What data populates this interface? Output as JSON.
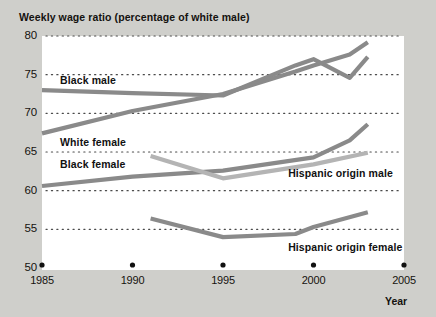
{
  "chart_data": {
    "type": "line",
    "title": "Weekly wage ratio (percentage of white male)",
    "xlabel": "Year",
    "ylabel": "",
    "xlim": [
      1985,
      2005
    ],
    "ylim": [
      50,
      80
    ],
    "xticks": [
      "1985",
      "1990",
      "1995",
      "2000",
      "2005"
    ],
    "yticks": [
      "50",
      "55",
      "60",
      "65",
      "70",
      "75",
      "80"
    ],
    "grid": "horizontal-dotted",
    "legend": "inline-labels",
    "series": [
      {
        "name": "Black male",
        "color": "#8a8a8a",
        "label_x": 1986.0,
        "label_y": 74.2,
        "x": [
          1985,
          1990,
          1995,
          1999,
          2000,
          2002,
          2003
        ],
        "values": [
          73.0,
          72.6,
          72.3,
          76.2,
          77.0,
          74.6,
          77.3
        ]
      },
      {
        "name": "White female",
        "color": "#8a8a8a",
        "label_x": 1986.0,
        "label_y": 66.1,
        "x": [
          1985,
          1990,
          1995,
          1999,
          2000,
          2002,
          2003
        ],
        "values": [
          67.4,
          70.3,
          72.5,
          75.4,
          76.2,
          77.6,
          79.2
        ]
      },
      {
        "name": "Black female",
        "color": "#8a8a8a",
        "label_x": 1986.0,
        "label_y": 63.3,
        "x": [
          1985,
          1990,
          1995,
          2000,
          2002,
          2003
        ],
        "values": [
          60.6,
          61.8,
          62.6,
          64.3,
          66.5,
          68.6
        ]
      },
      {
        "name": "Hispanic origin male",
        "color": "#b4b4b4",
        "label_x": 1998.6,
        "label_y": 62.2,
        "x": [
          1991,
          1995,
          2000,
          2003
        ],
        "values": [
          64.5,
          61.6,
          63.4,
          64.9
        ]
      },
      {
        "name": "Hispanic origin female",
        "color": "#8a8a8a",
        "label_x": 1998.6,
        "label_y": 52.6,
        "x": [
          1991,
          1995,
          1999,
          2000,
          2003
        ],
        "values": [
          56.4,
          54.0,
          54.4,
          55.3,
          57.2
        ]
      }
    ]
  }
}
